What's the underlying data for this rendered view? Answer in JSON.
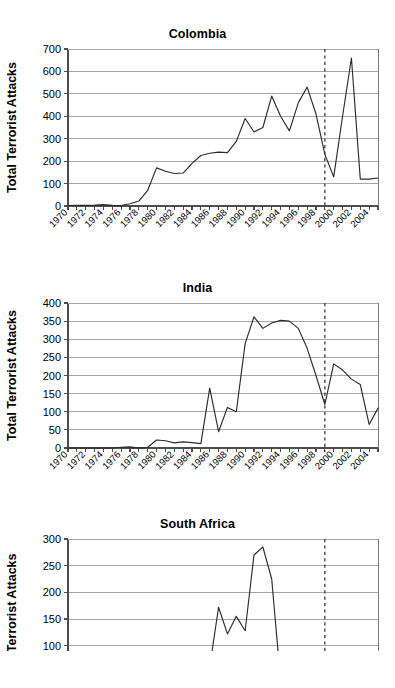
{
  "figure": {
    "ylabel": "Total Terrorist Attacks",
    "xlabels": [
      "1970",
      "1971",
      "1972",
      "1973",
      "1974",
      "1975",
      "1976",
      "1977",
      "1978",
      "1979",
      "1980",
      "1981",
      "1982",
      "1983",
      "1984",
      "1985",
      "1986",
      "1987",
      "1988",
      "1989",
      "1990",
      "1991",
      "1992",
      "1993",
      "1994",
      "1995",
      "1996",
      "1997",
      "1998",
      "1999",
      "2000",
      "2001",
      "2002",
      "2003",
      "2004",
      "2005"
    ],
    "xtick_labels": [
      "1970",
      "1972",
      "1974",
      "1976",
      "1978",
      "1980",
      "1982",
      "1984",
      "1986",
      "1988",
      "1990",
      "1992",
      "1994",
      "1996",
      "1998",
      "2000",
      "2002",
      "2004"
    ],
    "line_color": "#2b2b2b",
    "grid_color": "#a6a6a6",
    "marker_line_color": "#3a3a3a"
  },
  "chart_data": [
    {
      "type": "line",
      "title": "Colombia",
      "xlabel": "",
      "ylabel": "Total Terrorist Attacks",
      "xlim": [
        1970,
        2005
      ],
      "ylim": [
        0,
        700
      ],
      "yticks": [
        0,
        100,
        200,
        300,
        400,
        500,
        600,
        700
      ],
      "grid": true,
      "legend": "none",
      "annotations": [
        {
          "type": "vline",
          "x": 1999,
          "style": "dashed"
        }
      ],
      "x": [
        1970,
        1971,
        1972,
        1973,
        1974,
        1975,
        1976,
        1977,
        1978,
        1979,
        1980,
        1981,
        1982,
        1983,
        1984,
        1985,
        1986,
        1987,
        1988,
        1989,
        1990,
        1991,
        1992,
        1993,
        1994,
        1995,
        1996,
        1997,
        1998,
        1999,
        2000,
        2001,
        2002,
        2003,
        2004,
        2005
      ],
      "values": [
        2,
        3,
        3,
        4,
        6,
        3,
        2,
        10,
        22,
        70,
        170,
        155,
        145,
        147,
        190,
        225,
        235,
        240,
        238,
        288,
        390,
        330,
        350,
        490,
        400,
        335,
        460,
        530,
        410,
        230,
        130,
        400,
        660,
        120,
        120,
        125,
        135,
        130,
        120,
        60
      ]
    },
    {
      "type": "line",
      "title": "India",
      "xlabel": "",
      "ylabel": "Total Terrorist Attacks",
      "xlim": [
        1970,
        2005
      ],
      "ylim": [
        0,
        400
      ],
      "yticks": [
        0,
        50,
        100,
        150,
        200,
        250,
        300,
        350,
        400
      ],
      "grid": true,
      "legend": "none",
      "annotations": [
        {
          "type": "vline",
          "x": 1999,
          "style": "dashed"
        }
      ],
      "x": [
        1970,
        1971,
        1972,
        1973,
        1974,
        1975,
        1976,
        1977,
        1978,
        1979,
        1980,
        1981,
        1982,
        1983,
        1984,
        1985,
        1986,
        1987,
        1988,
        1989,
        1990,
        1991,
        1992,
        1993,
        1994,
        1995,
        1996,
        1997,
        1998,
        1999,
        2000,
        2001,
        2002,
        2003,
        2004,
        2005
      ],
      "values": [
        0,
        0,
        0,
        0,
        0,
        0,
        2,
        3,
        0,
        2,
        22,
        20,
        14,
        17,
        15,
        12,
        165,
        45,
        112,
        100,
        288,
        362,
        330,
        345,
        352,
        350,
        330,
        275,
        200,
        120,
        232,
        215,
        190,
        175,
        65,
        110,
        150,
        165,
        200,
        140,
        205,
        200,
        115
      ]
    },
    {
      "type": "line",
      "title": "South Africa",
      "xlabel": "",
      "ylabel": "Total Terrorist Attacks",
      "xlim": [
        1970,
        2005
      ],
      "ylim": [
        0,
        300
      ],
      "yticks": [
        0,
        50,
        100,
        150,
        200,
        250,
        300
      ],
      "grid": true,
      "legend": "none",
      "annotations": [
        {
          "type": "vline",
          "x": 1999,
          "style": "dashed"
        }
      ],
      "x": [
        1970,
        1971,
        1972,
        1973,
        1974,
        1975,
        1976,
        1977,
        1978,
        1979,
        1980,
        1981,
        1982,
        1983,
        1984,
        1985,
        1986,
        1987,
        1988,
        1989,
        1990,
        1991,
        1992,
        1993,
        1994,
        1995,
        1996,
        1997,
        1998,
        1999,
        2000,
        2001,
        2002,
        2003,
        2004,
        2005
      ],
      "values": [
        0,
        0,
        0,
        0,
        0,
        0,
        0,
        2,
        4,
        10,
        40,
        12,
        18,
        25,
        48,
        72,
        60,
        172,
        122,
        155,
        128,
        270,
        285,
        225,
        35,
        48,
        10
      ]
    }
  ],
  "panels": [
    {
      "title": "Colombia",
      "ymax": 700,
      "ystep": 100
    },
    {
      "title": "India",
      "ymax": 400,
      "ystep": 50
    },
    {
      "title": "South Africa",
      "ymax": 300,
      "ystep": 50
    }
  ]
}
